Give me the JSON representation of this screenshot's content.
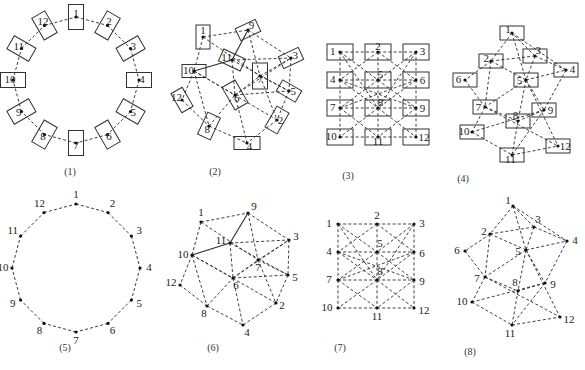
{
  "figure": {
    "panels": [
      {
        "id": "p1",
        "label": "(1)",
        "kind": "ring-boxes",
        "nodes": [
          "1",
          "2",
          "3",
          "4",
          "5",
          "6",
          "7",
          "8",
          "9",
          "10",
          "11",
          "12"
        ]
      },
      {
        "id": "p2",
        "label": "(2)",
        "kind": "graph-boxes",
        "nodes": [
          "1",
          "2",
          "3",
          "4",
          "5",
          "6",
          "7",
          "8",
          "9",
          "10",
          "11",
          "12"
        ]
      },
      {
        "id": "p3",
        "label": "(3)",
        "kind": "grid-boxes",
        "nodes": [
          "1",
          "2",
          "3",
          "4",
          "5",
          "6",
          "7",
          "8",
          "9",
          "10",
          "11",
          "12"
        ]
      },
      {
        "id": "p4",
        "label": "(4)",
        "kind": "graph-boxes",
        "nodes": [
          "1",
          "2",
          "3",
          "4",
          "5",
          "6",
          "7",
          "8",
          "9",
          "10",
          "11",
          "12"
        ]
      },
      {
        "id": "p5",
        "label": "(5)",
        "kind": "ring-points",
        "nodes": [
          "1",
          "2",
          "3",
          "4",
          "5",
          "6",
          "7",
          "8",
          "9",
          "10",
          "11",
          "12"
        ]
      },
      {
        "id": "p6",
        "label": "(6)",
        "kind": "graph-points",
        "nodes": [
          "1",
          "2",
          "3",
          "4",
          "5",
          "6",
          "7",
          "8",
          "9",
          "10",
          "11",
          "12"
        ]
      },
      {
        "id": "p7",
        "label": "(7)",
        "kind": "grid-points",
        "nodes": [
          "1",
          "2",
          "3",
          "4",
          "5",
          "6",
          "7",
          "8",
          "9",
          "10",
          "11",
          "12"
        ]
      },
      {
        "id": "p8",
        "label": "(8)",
        "kind": "graph-points",
        "nodes": [
          "1",
          "2",
          "3",
          "4",
          "5",
          "6",
          "7",
          "8",
          "9",
          "10",
          "11",
          "12"
        ]
      }
    ],
    "edges": {
      "ring": [
        [
          "1",
          "2"
        ],
        [
          "2",
          "3"
        ],
        [
          "3",
          "4"
        ],
        [
          "4",
          "5"
        ],
        [
          "5",
          "6"
        ],
        [
          "6",
          "7"
        ],
        [
          "7",
          "8"
        ],
        [
          "8",
          "9"
        ],
        [
          "9",
          "10"
        ],
        [
          "10",
          "11"
        ],
        [
          "11",
          "12"
        ],
        [
          "12",
          "1"
        ]
      ],
      "graph6": [
        [
          "1",
          "9"
        ],
        [
          "1",
          "10"
        ],
        [
          "1",
          "7"
        ],
        [
          "9",
          "3"
        ],
        [
          "9",
          "7"
        ],
        [
          "11",
          "3"
        ],
        [
          "11",
          "6"
        ],
        [
          "11",
          "5"
        ],
        [
          "10",
          "12"
        ],
        [
          "10",
          "8"
        ],
        [
          "10",
          "6"
        ],
        [
          "10",
          "2"
        ],
        [
          "12",
          "8"
        ],
        [
          "8",
          "4"
        ],
        [
          "8",
          "6"
        ],
        [
          "6",
          "4"
        ],
        [
          "6",
          "5"
        ],
        [
          "6",
          "7"
        ],
        [
          "6",
          "3"
        ],
        [
          "7",
          "3"
        ],
        [
          "7",
          "2"
        ],
        [
          "5",
          "2"
        ],
        [
          "3",
          "5"
        ],
        [
          "2",
          "4"
        ],
        [
          "7",
          "5"
        ]
      ],
      "graph6_solid": [
        [
          "9",
          "11"
        ],
        [
          "11",
          "10"
        ]
      ],
      "grid7": [
        [
          "1",
          "2"
        ],
        [
          "2",
          "3"
        ],
        [
          "4",
          "5"
        ],
        [
          "5",
          "6"
        ],
        [
          "7",
          "8"
        ],
        [
          "8",
          "9"
        ],
        [
          "10",
          "11"
        ],
        [
          "11",
          "12"
        ],
        [
          "1",
          "4"
        ],
        [
          "4",
          "7"
        ],
        [
          "7",
          "10"
        ],
        [
          "2",
          "5"
        ],
        [
          "5",
          "8"
        ],
        [
          "8",
          "11"
        ],
        [
          "3",
          "6"
        ],
        [
          "6",
          "9"
        ],
        [
          "9",
          "12"
        ],
        [
          "1",
          "5"
        ],
        [
          "5",
          "9"
        ],
        [
          "9",
          "11"
        ],
        [
          "3",
          "5"
        ],
        [
          "5",
          "7"
        ],
        [
          "7",
          "11"
        ],
        [
          "2",
          "4"
        ],
        [
          "2",
          "6"
        ],
        [
          "4",
          "8"
        ],
        [
          "6",
          "8"
        ],
        [
          "8",
          "10"
        ],
        [
          "8",
          "12"
        ],
        [
          "4",
          "9"
        ],
        [
          "6",
          "7"
        ],
        [
          "1",
          "8"
        ],
        [
          "3",
          "8"
        ]
      ],
      "graph8": [
        [
          "1",
          "2"
        ],
        [
          "1",
          "5"
        ],
        [
          "1",
          "4"
        ],
        [
          "2",
          "3"
        ],
        [
          "2",
          "6"
        ],
        [
          "2",
          "5"
        ],
        [
          "2",
          "7"
        ],
        [
          "3",
          "5"
        ],
        [
          "3",
          "4"
        ],
        [
          "5",
          "4"
        ],
        [
          "5",
          "7"
        ],
        [
          "5",
          "8"
        ],
        [
          "5",
          "9"
        ],
        [
          "5",
          "12"
        ],
        [
          "6",
          "7"
        ],
        [
          "7",
          "10"
        ],
        [
          "7",
          "8"
        ],
        [
          "7",
          "12"
        ],
        [
          "4",
          "9"
        ],
        [
          "9",
          "8"
        ],
        [
          "9",
          "10"
        ],
        [
          "9",
          "11"
        ],
        [
          "8",
          "11"
        ],
        [
          "10",
          "11"
        ],
        [
          "11",
          "12"
        ],
        [
          "3",
          "1"
        ]
      ]
    }
  }
}
